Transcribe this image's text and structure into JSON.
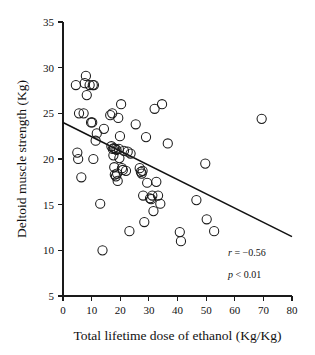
{
  "chart_data": {
    "type": "scatter",
    "title": "",
    "xlabel": "Total lifetime dose of ethanol (Kg/Kg)",
    "ylabel": "Deltoid muscle strength (Kg)",
    "xlim": [
      0,
      80
    ],
    "ylim": [
      5,
      35
    ],
    "xticks": [
      0,
      10,
      20,
      30,
      40,
      50,
      60,
      70,
      80
    ],
    "yticks": [
      5,
      10,
      15,
      20,
      25,
      30,
      35
    ],
    "xticklabels": [
      "0",
      "10",
      "20",
      "30",
      "40",
      "50",
      "60",
      "70",
      "80"
    ],
    "yticklabels": [
      "5",
      "10",
      "15",
      "20",
      "25",
      "30",
      "35"
    ],
    "grid": false,
    "legend": null,
    "marker": "open-circle",
    "marker_size": 4.6,
    "series": [
      {
        "name": "subjects",
        "points": [
          [
            4.5,
            28.1
          ],
          [
            5.0,
            20.7
          ],
          [
            5.3,
            20.0
          ],
          [
            5.6,
            25.0
          ],
          [
            6.4,
            18.0
          ],
          [
            7.2,
            25.0
          ],
          [
            7.6,
            28.3
          ],
          [
            8.0,
            29.1
          ],
          [
            8.3,
            27.0
          ],
          [
            9.3,
            28.1
          ],
          [
            9.8,
            24.0
          ],
          [
            10.2,
            24.0
          ],
          [
            10.4,
            28.1
          ],
          [
            10.8,
            28.1
          ],
          [
            10.6,
            20.0
          ],
          [
            11.4,
            22.0
          ],
          [
            11.8,
            22.8
          ],
          [
            13.0,
            15.1
          ],
          [
            13.8,
            10.0
          ],
          [
            14.3,
            23.3
          ],
          [
            16.5,
            24.8
          ],
          [
            16.9,
            21.4
          ],
          [
            17.2,
            25.0
          ],
          [
            17.4,
            21.1
          ],
          [
            17.6,
            20.4
          ],
          [
            17.8,
            21.2
          ],
          [
            17.9,
            19.1
          ],
          [
            18.1,
            18.3
          ],
          [
            18.3,
            21.1
          ],
          [
            18.5,
            18.1
          ],
          [
            18.7,
            21.0
          ],
          [
            18.9,
            18.4
          ],
          [
            19.1,
            17.6
          ],
          [
            19.3,
            24.5
          ],
          [
            19.5,
            21.1
          ],
          [
            19.7,
            20.1
          ],
          [
            19.9,
            22.5
          ],
          [
            20.3,
            26.0
          ],
          [
            20.6,
            19.0
          ],
          [
            20.9,
            18.8
          ],
          [
            21.3,
            20.9
          ],
          [
            22.0,
            18.7
          ],
          [
            22.6,
            20.8
          ],
          [
            23.2,
            12.1
          ],
          [
            23.6,
            20.6
          ],
          [
            25.4,
            23.8
          ],
          [
            26.8,
            19.0
          ],
          [
            27.2,
            18.6
          ],
          [
            27.5,
            18.4
          ],
          [
            27.8,
            18.7
          ],
          [
            28.0,
            16.0
          ],
          [
            28.4,
            13.1
          ],
          [
            29.0,
            22.4
          ],
          [
            29.4,
            17.4
          ],
          [
            30.4,
            15.7
          ],
          [
            30.8,
            15.6
          ],
          [
            31.2,
            16.0
          ],
          [
            31.6,
            14.3
          ],
          [
            32.0,
            25.5
          ],
          [
            32.6,
            17.5
          ],
          [
            33.2,
            16.0
          ],
          [
            34.0,
            15.1
          ],
          [
            34.6,
            26.0
          ],
          [
            36.6,
            21.7
          ],
          [
            40.8,
            12.0
          ],
          [
            41.2,
            11.0
          ],
          [
            46.6,
            15.5
          ],
          [
            49.7,
            19.5
          ],
          [
            50.2,
            13.4
          ],
          [
            52.8,
            12.1
          ],
          [
            69.4,
            24.4
          ]
        ]
      }
    ],
    "fit_line": {
      "name": "linear-regression",
      "x_start": 0,
      "y_start": 24.0,
      "x_end": 80,
      "y_end": 11.5
    },
    "annotations": [
      {
        "symbol": "r",
        "relation": " = ",
        "value": "−0.56"
      },
      {
        "symbol": "p",
        "relation": " < ",
        "value": "0.01"
      }
    ]
  }
}
